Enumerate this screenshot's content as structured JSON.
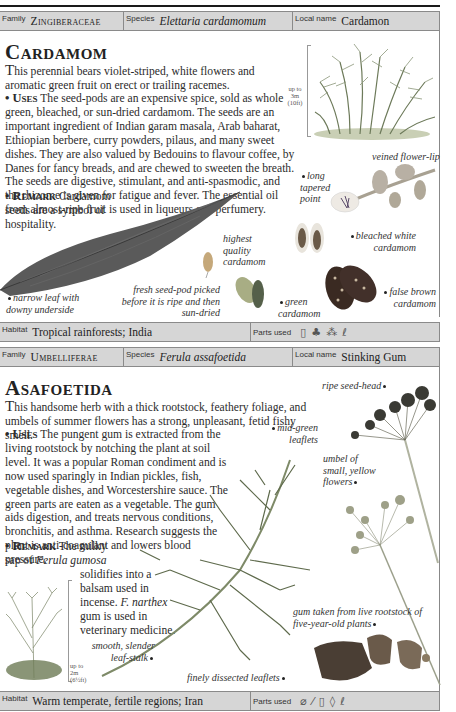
{
  "page": {
    "running_head": "HERBS AND SPICES"
  },
  "entries": [
    {
      "family_label": "Family",
      "family": "Zingiberaceae",
      "species_label": "Species",
      "species": "Elettaria cardamomum",
      "local_name_label": "Local name",
      "local_name": "Cardamon",
      "title": "Cardamom",
      "intro_lead": "T",
      "intro": "his perennial bears violet-striped, white flowers and aromatic green fruit on erect or trailing racemes.",
      "uses_label": "• Uses",
      "uses": "The seed-pods are an expensive spice, sold as whole green, bleached, or sun-dried cardamom. The seeds are an important ingredient of Indian garam masala, Arab baharat, Ethiopian berbere, curry powders, pilaus, and many sweet dishes. They are also valued by Bedouins to flavour coffee, by Danes for fancy breads, and are chewed to sweeten the breath. The seeds are digestive, stimulant, and anti-spasmodic, and the rhizome is given for fatigue and fever. The essential oil from almost-ripe fruit is used in liqueurs and perfumery.",
      "remark_label": "• Remark",
      "remark": "Cardamom seeds are a symbol of hospitality.",
      "scale": [
        "up to",
        "3m",
        "(10ft)"
      ],
      "captions": {
        "veined_flower_lip": "veined flower-lip",
        "long_tapered_point": "long tapered point",
        "bleached_white": "bleached white cardamom",
        "highest_quality": "highest quality cardamom",
        "fresh_seed_pod": "fresh seed-pod picked before it is ripe and then sun-dried",
        "green_cardamom": "green cardamom",
        "false_brown": "false brown cardamom",
        "narrow_leaf": "narrow leaf with downy underside"
      },
      "habitat_label": "Habitat",
      "habitat": "Tropical rainforests; India",
      "parts_used_label": "Parts used",
      "parts_used_icons": [
        "seed-icon",
        "fruit-icon",
        "seed-cluster-icon",
        "oil-icon"
      ]
    },
    {
      "family_label": "Family",
      "family": "Umbelliferae",
      "species_label": "Species",
      "species": "Ferula assafoetida",
      "local_name_label": "Local name",
      "local_name": "Stinking Gum",
      "title": "Asafoetida",
      "intro_lead": "T",
      "intro": "his handsome herb with a thick rootstock, feathery foliage, and umbels of summer flowers has a strong, unpleasant, fetid fishy smell.",
      "uses_label": "• Uses",
      "uses": "The pungent gum is extracted from the living rootstock by notching the plant at soil level. It was a popular Roman condiment and is now used sparingly in Indian pickles, fish, vegetable dishes, and Worcestershire sauce. The green parts are eaten as a vegetable. The gum aids digestion, and treats nervous conditions, bronchitis, and asthma. Research suggests the plant is anti-coagulant and lowers blood pressure.",
      "remark_label": "• Remark",
      "remark_pre": "The milky sap of",
      "remark_species": "Ferula gumosa",
      "remark_mid": "solidifies into a balsam used in incense.",
      "remark_species2": "F. narthex",
      "remark_post": "gum is used in veterinary medicine.",
      "scale": [
        "up to",
        "2m",
        "(6½ft)"
      ],
      "captions": {
        "ripe_seed_head": "ripe seed-head",
        "mid_green_leaflets": "mid-green leaflets",
        "umbel": "umbel of small, yellow flowers",
        "gum": "gum taken from live rootstock of five-year-old plants",
        "smooth_leaf_stalk": "smooth, slender leaf-stalk",
        "finely_dissected": "finely dissected leaflets"
      },
      "habitat_label": "Habitat",
      "habitat": "Warm temperate, fertile regions; Iran",
      "parts_used_label": "Parts used",
      "parts_used_icons": [
        "leaf-icon",
        "stem-icon",
        "seed-icon",
        "gum-drop-icon",
        "oil-icon"
      ]
    }
  ]
}
